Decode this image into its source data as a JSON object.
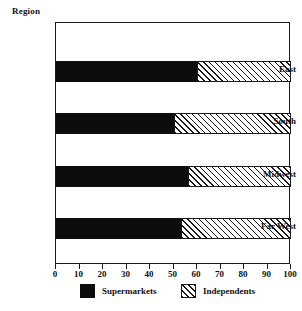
{
  "chart_data": {
    "type": "bar",
    "orientation": "horizontal",
    "stacked": true,
    "title": "",
    "axis_title": "Region",
    "categories": [
      "East",
      "South",
      "Midwest",
      "Far West"
    ],
    "series": [
      {
        "name": "Supermarkets",
        "swatch": "solid-black",
        "color": "#0d0d0d",
        "values": [
          60,
          50,
          56,
          53
        ]
      },
      {
        "name": "Independents",
        "swatch": "diagonal-hatch",
        "color": "#ffffff",
        "values": [
          40,
          50,
          44,
          47
        ]
      }
    ],
    "xlabel": "",
    "ylabel": "Region",
    "xlim": [
      0,
      100
    ],
    "x_ticks": [
      0,
      10,
      20,
      30,
      40,
      50,
      60,
      70,
      80,
      90,
      100
    ],
    "x_tick_labels": [
      "0",
      "10",
      "20",
      "30",
      "40",
      "50",
      "60",
      "70",
      "80",
      "90",
      "100"
    ],
    "grid": false,
    "frame": true,
    "legend": {
      "position": "bottom",
      "entries": [
        {
          "label": "Supermarkets",
          "swatch": "solid-black"
        },
        {
          "label": "Independents",
          "swatch": "diagonal-hatch"
        }
      ]
    }
  },
  "colors": {
    "supermarkets": "#0d0d0d",
    "independents": "#ffffff",
    "hatch_line": "#1a1a1a",
    "frame": "#1a1a1a",
    "text": "#111111",
    "background": "#ffffff"
  }
}
